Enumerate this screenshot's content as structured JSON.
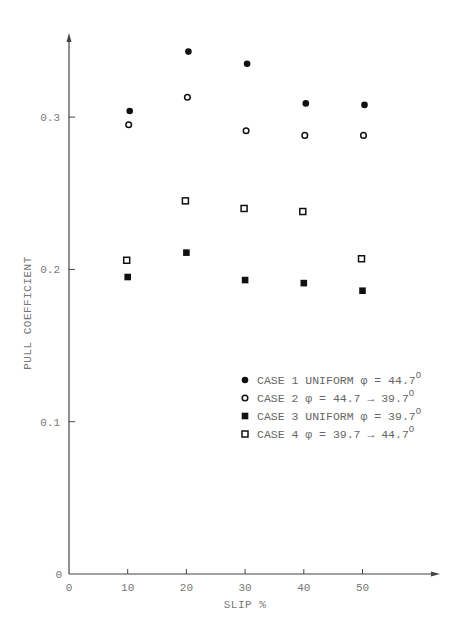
{
  "chart_data": {
    "type": "scatter",
    "title": "",
    "xlabel": "SLIP %",
    "ylabel": "PULL COEFFICIENT",
    "xlim": [
      0,
      60
    ],
    "ylim": [
      0,
      0.35
    ],
    "x_ticks": [
      "0",
      "10",
      "20",
      "30",
      "40",
      "50"
    ],
    "y_ticks": [
      "0",
      "0.1",
      "0.2",
      "0.3"
    ],
    "grid": false,
    "legend_position": "lower right (inside plot)",
    "x": [
      10,
      20,
      30,
      40,
      50
    ],
    "series": [
      {
        "name": "CASE 1 UNIFORM φ = 44.7°",
        "marker": "filled-circle",
        "values": [
          0.304,
          0.343,
          0.335,
          0.309,
          0.308
        ]
      },
      {
        "name": "CASE 2 φ = 44.7 → 39.7°",
        "marker": "open-circle",
        "values": [
          0.295,
          0.313,
          0.291,
          0.288,
          0.288
        ]
      },
      {
        "name": "CASE 3 UNIFORM φ = 39.7°",
        "marker": "filled-square",
        "values": [
          0.195,
          0.211,
          0.193,
          0.191,
          0.186
        ]
      },
      {
        "name": "CASE 4 φ = 39.7 → 44.7°",
        "marker": "open-square",
        "values": [
          0.206,
          0.245,
          0.24,
          0.238,
          0.207
        ]
      }
    ]
  },
  "axes": {
    "x_title": "SLIP %",
    "y_title": "PULL COEFFICIENT",
    "x_tick_labels": [
      "0",
      "10",
      "20",
      "30",
      "40",
      "50"
    ],
    "y_tick_labels": [
      "0",
      "0.1",
      "0.2",
      "0.3"
    ]
  },
  "legend": {
    "items": [
      {
        "prefix": "CASE 1 UNIFORM φ = 44.7",
        "sup": "O"
      },
      {
        "prefix": "CASE 2 φ = 44.7 → 39.7",
        "sup": "O"
      },
      {
        "prefix": "CASE 3 UNIFORM φ = 39.7",
        "sup": "O"
      },
      {
        "prefix": "CASE 4 φ = 39.7 → 44.7",
        "sup": "O"
      }
    ]
  },
  "colors": {
    "axis": "#444444",
    "marker": "#111111",
    "text": "#777777"
  }
}
